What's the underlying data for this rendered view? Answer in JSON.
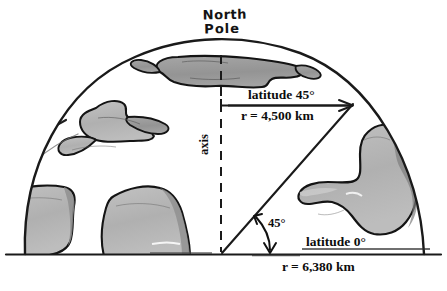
{
  "figure": {
    "kind": "earth-cross-section-diagram",
    "background_color": "#ffffff",
    "ink_color": "#111111",
    "land_fill_color": "#b3b3b3",
    "land_fill_dark_color": "#9a9a9a",
    "land_outline_color": "#1a1a1a"
  },
  "labels": {
    "north_pole_line1": "North",
    "north_pole_line2": "Pole",
    "axis": "axis",
    "latitude_45": "latitude 45°",
    "radius_45": "r = 4,500 km",
    "latitude_0": "latitude 0°",
    "radius_0": "r = 6,380 km",
    "angle": "45°"
  },
  "values": {
    "latitude_45_degrees": "45°",
    "latitude_45_radius_km": "4,500 km",
    "latitude_0_degrees": "0°",
    "latitude_0_radius_km": "6,380 km",
    "angle_at_center_degrees": "45°"
  },
  "geometry": {
    "equator_line_style": "solid",
    "axis_line_style": "dashed",
    "latitude_45_line_style": "solid",
    "radius_line_style": "solid",
    "angle_marker_style": "double-headed-arc-arrow"
  }
}
